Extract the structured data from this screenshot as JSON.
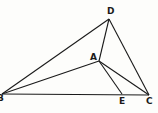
{
  "diagram": {
    "points": [
      {
        "id": "D",
        "label": "D"
      },
      {
        "id": "A",
        "label": "A"
      },
      {
        "id": "B",
        "label": "B"
      },
      {
        "id": "E",
        "label": "E"
      },
      {
        "id": "C",
        "label": "C"
      }
    ],
    "segments": [
      [
        "B",
        "D"
      ],
      [
        "D",
        "C"
      ],
      [
        "B",
        "C"
      ],
      [
        "B",
        "A"
      ],
      [
        "A",
        "D"
      ],
      [
        "A",
        "E"
      ],
      [
        "A",
        "C"
      ]
    ]
  }
}
